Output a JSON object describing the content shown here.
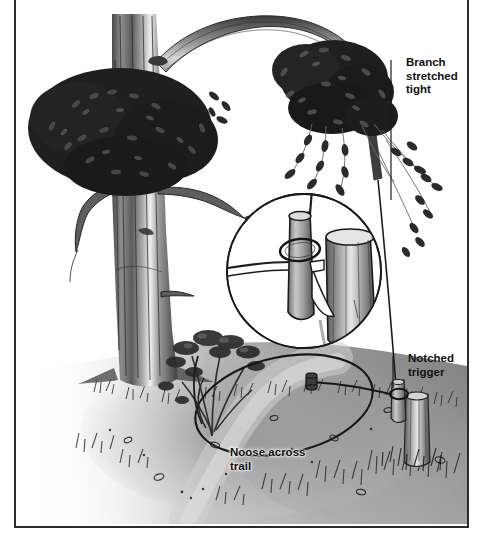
{
  "figure": {
    "medium": "pen-and-ink / graphite illustration",
    "frame_color": "#2b2b2b",
    "background_color": "#ffffff",
    "top_remnant_text": "blurred cropped caption text"
  },
  "labels": {
    "branch": "Branch\nstretched\ntight",
    "trigger": "Notched\ntrigger",
    "noose": "Noose across\ntrail"
  },
  "parts": {
    "tree_trunk": "tree-trunk",
    "foliage_left": "left-canopy-foliage",
    "foliage_right": "right-canopy-foliage",
    "bent_branch": "bent-spring-branch",
    "hanging_leaves": "hanging-leaf-sprays",
    "inset_circle": "trigger-detail-inset",
    "inset_stake": "anchor-stake",
    "inset_toggle": "notched-toggle-stick",
    "inset_cord_loop": "cord-loop",
    "ground": "forest-floor",
    "trail": "game-trail",
    "shrub": "small-shrub",
    "noose_loop": "noose-loop-on-trail",
    "trigger_stake": "ground-trigger-stake",
    "leader_line": "leader-line"
  },
  "colors": {
    "ink": "#1c1c1c",
    "mid_gray": "#6e6e6e",
    "light_gray": "#b9b9b9",
    "paper": "#ffffff",
    "foliage_dark": "#262626"
  }
}
